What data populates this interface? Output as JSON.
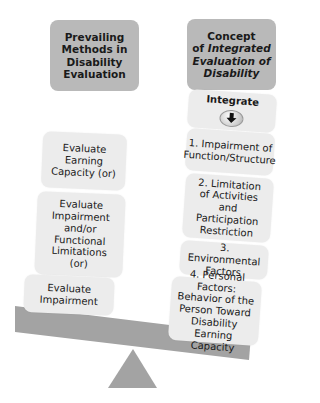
{
  "left_column": {
    "header": "Prevailing Methods in Disability Evaluation",
    "items": [
      {
        "text": "Evaluate Earning Capacity (or)"
      },
      {
        "text": "Evaluate Impairment and/or Functional Limitations (or)"
      },
      {
        "text": "Evaluate Impairment"
      }
    ]
  },
  "right_column": {
    "header_line1": "Concept",
    "header_line2_prefix": "of ",
    "header_italic": "Integrated Evaluation of Disability",
    "integrate_label": "Integrate",
    "integrate_icon": "down-arrow-icon",
    "items": [
      {
        "text": "1. Impairment of Function/Structure"
      },
      {
        "text": "2. Limitation of Activities and Participation Restriction"
      },
      {
        "text": "3. Environmental Factors"
      },
      {
        "text": "4. Personal Factors: Behavior of the Person Toward Disability Earning Capacity"
      }
    ]
  },
  "colors": {
    "header_fill": "#b9b9b9",
    "item_fill": "#ececec",
    "beam_fill": "#a3a3a3",
    "fulcrum_fill": "#a3a3a3"
  }
}
